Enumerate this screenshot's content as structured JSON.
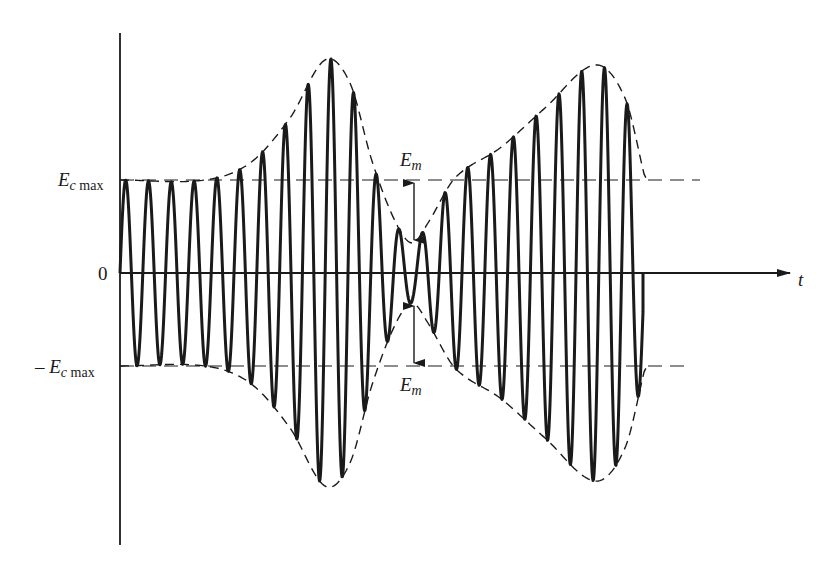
{
  "figure": {
    "title": "",
    "labels": {
      "ec_max_main": "E",
      "ec_max_sub_c": "c",
      "ec_max_sub_max": " max",
      "neg_prefix": "– ",
      "zero": "0",
      "time_axis": "t",
      "em_main": "E",
      "em_sub": "m"
    },
    "colors": {
      "stroke": "#1a1a1a",
      "background": "#ffffff"
    },
    "geometry": {
      "y_axis_x": 120,
      "y_axis_top": 33,
      "y_axis_bottom": 545,
      "zero_y": 273,
      "ec_max_y": 180,
      "neg_ec_max_y": 366,
      "time_axis_end_x": 790,
      "carrier_start_x": 120,
      "carrier_end_x": 643,
      "carrier_period_px": 22.8
    },
    "envelope_points": [
      {
        "x": 120,
        "amp": 93
      },
      {
        "x": 205,
        "amp": 93
      },
      {
        "x": 250,
        "amp": 110
      },
      {
        "x": 290,
        "amp": 155
      },
      {
        "x": 325,
        "amp": 213
      },
      {
        "x": 350,
        "amp": 190
      },
      {
        "x": 372,
        "amp": 112
      },
      {
        "x": 395,
        "amp": 52
      },
      {
        "x": 412,
        "amp": 30
      },
      {
        "x": 428,
        "amp": 50
      },
      {
        "x": 455,
        "amp": 95
      },
      {
        "x": 500,
        "amp": 125
      },
      {
        "x": 545,
        "amp": 165
      },
      {
        "x": 595,
        "amp": 208
      },
      {
        "x": 625,
        "amp": 175
      },
      {
        "x": 645,
        "amp": 95
      }
    ],
    "annotations": [
      {
        "type": "double-arrow",
        "x": 414,
        "from_y": 180,
        "to_y": 243,
        "label": "Em"
      },
      {
        "type": "double-arrow",
        "x": 414,
        "from_y": 303,
        "to_y": 366,
        "label": "Em"
      }
    ]
  }
}
